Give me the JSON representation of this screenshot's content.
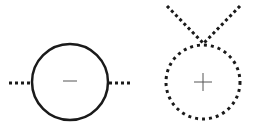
{
  "diagram": {
    "colors": {
      "stroke": "#1a1a1a",
      "sign": "#555555",
      "background": "#ffffff"
    },
    "left_symbol": {
      "sign": "minus",
      "outline": "solid",
      "leads": "horizontal-dotted"
    },
    "right_symbol": {
      "sign": "plus",
      "outline": "dotted",
      "leads": "crossing-dotted-above"
    }
  }
}
